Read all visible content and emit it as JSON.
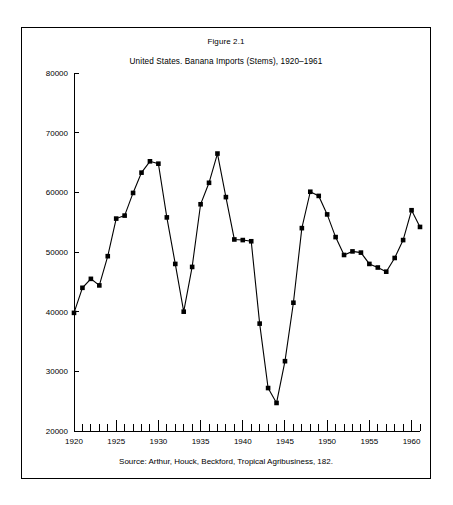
{
  "figure": {
    "number_label": "Figure 2.1",
    "title": "United States. Banana Imports (Stems), 1920–1961",
    "source": "Source: Arthur, Houck, Beckford, Tropical Agribusiness, 182."
  },
  "colors": {
    "line": "#000000",
    "marker": "#000000",
    "axis": "#000000",
    "background": "#ffffff",
    "frame_border": "#000000"
  },
  "chart_data": {
    "type": "line",
    "title": "United States. Banana Imports (Stems), 1920–1961",
    "subtitle": "Figure 2.1",
    "xlabel": "",
    "ylabel": "",
    "xlim": [
      1920,
      1961
    ],
    "ylim": [
      20000,
      80000
    ],
    "yticks": [
      20000,
      30000,
      40000,
      50000,
      60000,
      70000,
      80000
    ],
    "ytick_labels": [
      "20000",
      "30000",
      "40000",
      "50000",
      "60000",
      "70000",
      "80000"
    ],
    "xticks": [
      1920,
      1921,
      1922,
      1923,
      1924,
      1925,
      1926,
      1927,
      1928,
      1929,
      1930,
      1931,
      1932,
      1933,
      1934,
      1935,
      1936,
      1937,
      1938,
      1939,
      1940,
      1941,
      1942,
      1943,
      1944,
      1945,
      1946,
      1947,
      1948,
      1949,
      1950,
      1951,
      1952,
      1953,
      1954,
      1955,
      1956,
      1957,
      1958,
      1959,
      1960,
      1961
    ],
    "xtick_labels_shown": [
      "1920",
      "1925",
      "1930",
      "1935",
      "1940",
      "1945",
      "1950",
      "1955",
      "1960"
    ],
    "xtick_label_years": [
      1920,
      1925,
      1930,
      1935,
      1940,
      1945,
      1950,
      1955,
      1960
    ],
    "grid": false,
    "legend": false,
    "markers": "filled-square",
    "x": [
      1920,
      1921,
      1922,
      1923,
      1924,
      1925,
      1926,
      1927,
      1928,
      1929,
      1930,
      1931,
      1932,
      1933,
      1934,
      1935,
      1936,
      1937,
      1938,
      1939,
      1940,
      1941,
      1942,
      1943,
      1944,
      1945,
      1946,
      1947,
      1948,
      1949,
      1950,
      1951,
      1952,
      1953,
      1954,
      1955,
      1956,
      1957,
      1958,
      1959,
      1960,
      1961
    ],
    "values": [
      39800,
      44000,
      45500,
      44400,
      49300,
      55600,
      56100,
      59900,
      63300,
      65200,
      64800,
      55800,
      48000,
      40000,
      47500,
      58000,
      61600,
      66500,
      59200,
      52100,
      52000,
      51800,
      38000,
      27200,
      24700,
      31700,
      41500,
      54000,
      60100,
      59400,
      56300,
      52500,
      49500,
      50100,
      49900,
      48000,
      47400,
      46700,
      49000,
      52000,
      57000,
      54200
    ],
    "series": [
      {
        "name": "Banana imports (stems)",
        "values": [
          39800,
          44000,
          45500,
          44400,
          49300,
          55600,
          56100,
          59900,
          63300,
          65200,
          64800,
          55800,
          48000,
          40000,
          47500,
          58000,
          61600,
          66500,
          59200,
          52100,
          52000,
          51800,
          38000,
          27200,
          24700,
          31700,
          41500,
          54000,
          60100,
          59400,
          56300,
          52500,
          49500,
          50100,
          49900,
          48000,
          47400,
          46700,
          49000,
          52000,
          57000,
          54200
        ]
      }
    ]
  }
}
